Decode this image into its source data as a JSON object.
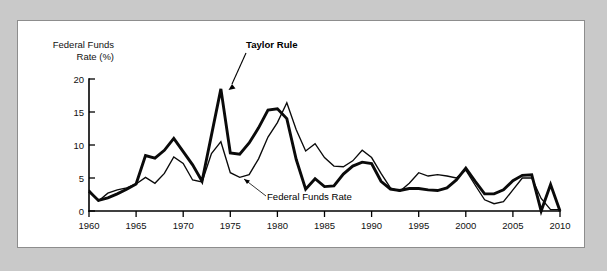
{
  "figure": {
    "background_color": "#c9c9c9",
    "panel_color": "#ffffff",
    "panel_border_color": "#8d8d8d",
    "line_color": "#0a0a0a"
  },
  "chart_data": {
    "type": "line",
    "title": "",
    "subtitle": "",
    "xlabel": "",
    "ylabel": "Federal Funds\nRate (%)",
    "ylabel_line1": "Federal Funds",
    "ylabel_line2": "Rate (%)",
    "xlim": [
      1960,
      2010
    ],
    "ylim": [
      0,
      20
    ],
    "grid": false,
    "legend_position": "inline-annotations",
    "x_ticks": [
      1960,
      1965,
      1970,
      1975,
      1980,
      1985,
      1990,
      1995,
      2000,
      2005,
      2010
    ],
    "x_tick_labels": [
      "1960",
      "1965",
      "1970",
      "1975",
      "1980",
      "1985",
      "1990",
      "1995",
      "2000",
      "2005",
      "2010"
    ],
    "y_ticks": [
      0,
      5,
      10,
      15,
      20
    ],
    "y_tick_labels": [
      "0",
      "5",
      "10",
      "15",
      "20"
    ],
    "annotations": [
      {
        "text": "Taylor Rule",
        "style": "bold",
        "points_to_series": "Taylor Rule",
        "points_to_x": 1974,
        "points_to_y": 18.5
      },
      {
        "text": "Federal Funds Rate",
        "style": "regular",
        "points_to_series": "Federal Funds Rate",
        "points_to_x": 1976,
        "points_to_y": 5.0
      }
    ],
    "x": [
      1960,
      1961,
      1962,
      1963,
      1964,
      1965,
      1966,
      1967,
      1968,
      1969,
      1970,
      1971,
      1972,
      1973,
      1974,
      1975,
      1976,
      1977,
      1978,
      1979,
      1980,
      1981,
      1982,
      1983,
      1984,
      1985,
      1986,
      1987,
      1988,
      1989,
      1990,
      1991,
      1992,
      1993,
      1994,
      1995,
      1996,
      1997,
      1998,
      1999,
      2000,
      2001,
      2002,
      2003,
      2004,
      2005,
      2006,
      2007,
      2008,
      2009,
      2010
    ],
    "series": [
      {
        "name": "Taylor Rule",
        "line_style": "thick",
        "line_width": 2.9,
        "values": [
          3.0,
          1.6,
          2.0,
          2.6,
          3.3,
          4.1,
          8.4,
          8.0,
          9.2,
          11.0,
          9.0,
          7.0,
          4.5,
          11.5,
          18.5,
          8.8,
          8.6,
          10.3,
          12.6,
          15.3,
          15.5,
          14.0,
          7.8,
          3.3,
          4.9,
          3.7,
          3.8,
          5.6,
          6.8,
          7.4,
          7.2,
          4.5,
          3.3,
          3.1,
          3.4,
          3.4,
          3.2,
          3.1,
          3.5,
          4.7,
          6.5,
          4.5,
          2.6,
          2.6,
          3.2,
          4.6,
          5.4,
          5.5,
          0.0,
          4.0,
          0.0
        ]
      },
      {
        "name": "Federal Funds Rate",
        "line_style": "thin",
        "line_width": 1.35,
        "values": [
          3.2,
          1.5,
          2.7,
          3.2,
          3.5,
          4.1,
          5.1,
          4.2,
          5.7,
          8.2,
          7.2,
          4.7,
          4.4,
          8.7,
          10.5,
          5.8,
          5.1,
          5.5,
          7.9,
          11.2,
          13.4,
          16.4,
          12.3,
          9.1,
          10.2,
          8.1,
          6.8,
          6.7,
          7.6,
          9.2,
          8.1,
          5.7,
          3.5,
          3.0,
          4.2,
          5.8,
          5.3,
          5.5,
          5.3,
          5.0,
          6.2,
          3.9,
          1.7,
          1.1,
          1.4,
          3.2,
          5.0,
          5.0,
          1.9,
          0.2,
          0.2
        ]
      }
    ]
  }
}
